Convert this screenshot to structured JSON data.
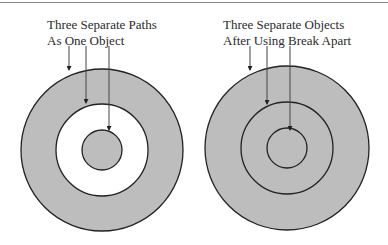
{
  "diagram": {
    "left": {
      "caption_line1": "Three Separate Paths",
      "caption_line2": "As One Object",
      "description": "Three concentric circular paths combined as one compound object; middle area is a hole (white)",
      "fill_color": "#bdbdbd",
      "hole_color": "#ffffff"
    },
    "right": {
      "caption_line1": "Three Separate Objects",
      "caption_line2": "After Using Break Apart",
      "description": "Three concentric circles as separate objects, all filled gray",
      "fill_color": "#bdbdbd"
    },
    "stroke_color": "#222222"
  }
}
